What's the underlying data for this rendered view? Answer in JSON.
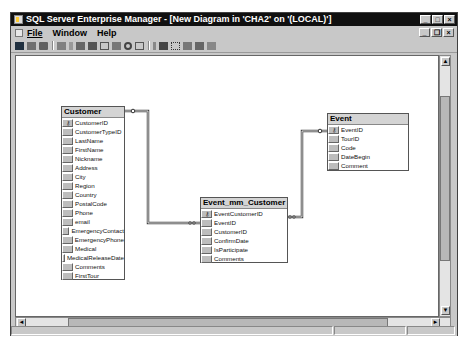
{
  "window": {
    "title": "SQL Server Enterprise Manager - [New Diagram in 'CHA2' on '(LOCAL)']",
    "controls": {
      "minimize": "_",
      "maximize": "□",
      "close": "×"
    }
  },
  "menubar": {
    "items": [
      {
        "label": "File",
        "accel": "F"
      },
      {
        "label": "Window",
        "accel": "W"
      },
      {
        "label": "Help",
        "accel": "H"
      }
    ],
    "mdi_controls": {
      "minimize": "_",
      "restore": "❐",
      "close": "×"
    }
  },
  "toolbar": {
    "icons": [
      "save-icon",
      "properties-icon",
      "print-icon",
      "separator",
      "new-table-icon",
      "cut-icon",
      "copy-icon",
      "paste-icon",
      "add-table-icon",
      "relationship-icon",
      "zoom-icon",
      "show-icon",
      "separator",
      "key-icon",
      "indexes-icon",
      "arrange-tables-icon",
      "arrange-selection-icon",
      "autosize-icon",
      "text-annotation-icon"
    ]
  },
  "diagram": {
    "tables": [
      {
        "name": "Customer",
        "columns": [
          {
            "name": "CustomerID",
            "key": true
          },
          {
            "name": "CustomerTypeID",
            "key": false
          },
          {
            "name": "LastName",
            "key": false
          },
          {
            "name": "FirstName",
            "key": false
          },
          {
            "name": "Nickname",
            "key": false
          },
          {
            "name": "Address",
            "key": false
          },
          {
            "name": "City",
            "key": false
          },
          {
            "name": "Region",
            "key": false
          },
          {
            "name": "Country",
            "key": false
          },
          {
            "name": "PostalCode",
            "key": false
          },
          {
            "name": "Phone",
            "key": false
          },
          {
            "name": "email",
            "key": false
          },
          {
            "name": "EmergencyContact",
            "key": false
          },
          {
            "name": "EmergencyPhone",
            "key": false
          },
          {
            "name": "Medical",
            "key": false
          },
          {
            "name": "MedicalReleaseDate",
            "key": false
          },
          {
            "name": "Comments",
            "key": false
          },
          {
            "name": "FirstTour",
            "key": false
          }
        ]
      },
      {
        "name": "Event_mm_Customer",
        "columns": [
          {
            "name": "EventCustomerID",
            "key": true
          },
          {
            "name": "EventID",
            "key": false
          },
          {
            "name": "CustomerID",
            "key": false
          },
          {
            "name": "ConfirmDate",
            "key": false
          },
          {
            "name": "IsParticipate",
            "key": false
          },
          {
            "name": "Comments",
            "key": false
          }
        ]
      },
      {
        "name": "Event",
        "columns": [
          {
            "name": "EventID",
            "key": true
          },
          {
            "name": "TourID",
            "key": false
          },
          {
            "name": "Code",
            "key": false
          },
          {
            "name": "DateBegin",
            "key": false
          },
          {
            "name": "Comment",
            "key": false
          }
        ]
      }
    ],
    "relationships": [
      {
        "from": "Customer.CustomerID",
        "to": "Event_mm_Customer.CustomerID",
        "type": "one-to-many"
      },
      {
        "from": "Event.EventID",
        "to": "Event_mm_Customer.EventID",
        "type": "one-to-many"
      }
    ]
  },
  "scrollbars": {
    "up": "▲",
    "down": "▼",
    "left": "◄",
    "right": "►"
  }
}
